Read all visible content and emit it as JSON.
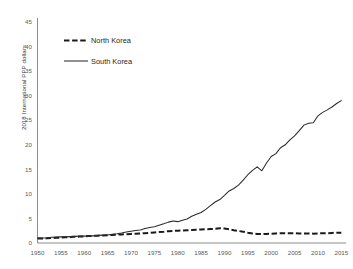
{
  "chart_data": {
    "type": "line",
    "title": "",
    "xlabel": "",
    "ylabel": "2018 International PPP dollars",
    "xlim": [
      1950,
      2016
    ],
    "ylim": [
      0,
      45
    ],
    "grid": false,
    "legend_position": "upper-left-inside",
    "x_ticks": [
      1950,
      1955,
      1960,
      1965,
      1970,
      1975,
      1980,
      1985,
      1990,
      1995,
      2000,
      2005,
      2010,
      2015
    ],
    "y_ticks": [
      0,
      5,
      10,
      15,
      20,
      25,
      30,
      35,
      40,
      45
    ],
    "x": [
      1950,
      1951,
      1952,
      1953,
      1954,
      1955,
      1956,
      1957,
      1958,
      1959,
      1960,
      1961,
      1962,
      1963,
      1964,
      1965,
      1966,
      1967,
      1968,
      1969,
      1970,
      1971,
      1972,
      1973,
      1974,
      1975,
      1976,
      1977,
      1978,
      1979,
      1980,
      1981,
      1982,
      1983,
      1984,
      1985,
      1986,
      1987,
      1988,
      1989,
      1990,
      1991,
      1992,
      1993,
      1994,
      1995,
      1996,
      1997,
      1998,
      1999,
      2000,
      2001,
      2002,
      2003,
      2004,
      2005,
      2006,
      2007,
      2008,
      2009,
      2010,
      2011,
      2012,
      2013,
      2014,
      2015
    ],
    "series": [
      {
        "name": "North Korea",
        "style": "dashed",
        "color": "#1a1a1a",
        "values": [
          0.9,
          0.9,
          0.95,
          1.0,
          1.05,
          1.1,
          1.15,
          1.2,
          1.25,
          1.3,
          1.35,
          1.4,
          1.45,
          1.5,
          1.55,
          1.6,
          1.65,
          1.7,
          1.75,
          1.8,
          1.85,
          1.9,
          1.95,
          2.0,
          2.05,
          2.15,
          2.25,
          2.3,
          2.4,
          2.45,
          2.5,
          2.55,
          2.6,
          2.65,
          2.7,
          2.75,
          2.8,
          2.85,
          2.9,
          3.0,
          2.95,
          2.8,
          2.6,
          2.45,
          2.3,
          2.1,
          1.95,
          1.85,
          1.8,
          1.85,
          1.9,
          1.95,
          2.0,
          2.0,
          2.0,
          2.0,
          1.95,
          1.95,
          1.95,
          1.9,
          1.95,
          2.0,
          2.0,
          2.05,
          2.1,
          2.1
        ]
      },
      {
        "name": "South Korea",
        "style": "solid",
        "color": "#2b2b2b",
        "values": [
          1.0,
          1.0,
          1.05,
          1.15,
          1.2,
          1.25,
          1.25,
          1.3,
          1.35,
          1.4,
          1.4,
          1.45,
          1.45,
          1.55,
          1.6,
          1.65,
          1.8,
          1.9,
          2.05,
          2.25,
          2.4,
          2.55,
          2.65,
          2.95,
          3.15,
          3.3,
          3.6,
          3.9,
          4.25,
          4.5,
          4.35,
          4.65,
          4.9,
          5.45,
          5.85,
          6.2,
          6.85,
          7.6,
          8.35,
          8.85,
          9.7,
          10.6,
          11.1,
          11.8,
          12.8,
          13.9,
          14.8,
          15.5,
          14.7,
          16.3,
          17.6,
          18.2,
          19.4,
          20.0,
          21.0,
          21.8,
          22.9,
          24.0,
          24.4,
          24.5,
          25.9,
          26.6,
          27.1,
          27.7,
          28.4,
          29.0
        ]
      }
    ],
    "note_south_endpoint": 40.5,
    "note_north_peak_year": 1989
  },
  "legend": {
    "entries": [
      {
        "label": "North Korea",
        "marker": "dashed-line"
      },
      {
        "label": "South Korea",
        "marker": "solid-line"
      }
    ]
  }
}
